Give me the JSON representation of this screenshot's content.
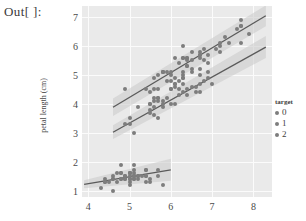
{
  "prompt": {
    "label": "Out[ ]:"
  },
  "chart_data": {
    "type": "scatter",
    "title": "",
    "xlabel": "",
    "ylabel": "petal length (cm)",
    "xlim": [
      3.85,
      8.45
    ],
    "ylim": [
      0.78,
      7.38
    ],
    "xticks": [
      "4",
      "5",
      "6",
      "7",
      "8"
    ],
    "xtick_values": [
      4,
      5,
      6,
      7,
      8
    ],
    "yticks": [
      "1",
      "2",
      "3",
      "4",
      "5",
      "6",
      "7"
    ],
    "ytick_values": [
      1,
      2,
      3,
      4,
      5,
      6,
      7
    ],
    "grid": true,
    "grid_color": "#fbfbfb",
    "plot_background": "#eaeaea",
    "point_color": "#7d7d7d",
    "line_color": "#5a5a5a",
    "band_color": "#c9c9c9",
    "legend": {
      "title": "target",
      "position": "right",
      "entries": [
        {
          "label": "0",
          "color": "#7d7d7d"
        },
        {
          "label": "1",
          "color": "#7d7d7d"
        },
        {
          "label": "2",
          "color": "#7d7d7d"
        }
      ]
    },
    "series": [
      {
        "name": "0",
        "color": "#7d7d7d",
        "fit": {
          "x": [
            3.9,
            6.0
          ],
          "y": [
            1.22,
            1.72
          ]
        },
        "band": {
          "x": [
            3.9,
            6.0
          ],
          "upper": [
            1.36,
            2.1
          ],
          "lower": [
            1.08,
            1.34
          ]
        },
        "points": [
          [
            5.1,
            1.4
          ],
          [
            4.9,
            1.4
          ],
          [
            4.7,
            1.3
          ],
          [
            4.6,
            1.5
          ],
          [
            5.0,
            1.4
          ],
          [
            5.4,
            1.7
          ],
          [
            4.6,
            1.4
          ],
          [
            5.0,
            1.5
          ],
          [
            4.4,
            1.4
          ],
          [
            4.9,
            1.5
          ],
          [
            5.4,
            1.5
          ],
          [
            4.8,
            1.6
          ],
          [
            4.8,
            1.4
          ],
          [
            4.3,
            1.1
          ],
          [
            5.8,
            1.2
          ],
          [
            5.7,
            1.5
          ],
          [
            5.4,
            1.3
          ],
          [
            5.1,
            1.4
          ],
          [
            5.7,
            1.7
          ],
          [
            5.1,
            1.5
          ],
          [
            5.4,
            1.7
          ],
          [
            5.1,
            1.5
          ],
          [
            4.6,
            1.0
          ],
          [
            5.1,
            1.7
          ],
          [
            4.8,
            1.9
          ],
          [
            5.0,
            1.6
          ],
          [
            5.0,
            1.6
          ],
          [
            5.2,
            1.5
          ],
          [
            5.2,
            1.4
          ],
          [
            4.7,
            1.6
          ],
          [
            4.8,
            1.6
          ],
          [
            5.4,
            1.5
          ],
          [
            5.2,
            1.5
          ],
          [
            5.5,
            1.4
          ],
          [
            4.9,
            1.5
          ],
          [
            5.0,
            1.2
          ],
          [
            5.5,
            1.3
          ],
          [
            4.9,
            1.4
          ],
          [
            4.4,
            1.3
          ],
          [
            5.1,
            1.5
          ],
          [
            5.0,
            1.3
          ],
          [
            4.5,
            1.3
          ],
          [
            4.4,
            1.3
          ],
          [
            5.0,
            1.6
          ],
          [
            5.1,
            1.9
          ],
          [
            4.8,
            1.4
          ],
          [
            5.1,
            1.6
          ],
          [
            4.6,
            1.4
          ],
          [
            5.3,
            1.5
          ],
          [
            5.0,
            1.4
          ]
        ]
      },
      {
        "name": "1",
        "color": "#7d7d7d",
        "fit": {
          "x": [
            4.6,
            8.3
          ],
          "y": [
            3.02,
            5.96
          ]
        },
        "band": {
          "x": [
            4.6,
            8.3
          ],
          "upper": [
            3.26,
            6.34
          ],
          "lower": [
            2.78,
            5.58
          ]
        },
        "points": [
          [
            7.0,
            4.7
          ],
          [
            6.4,
            4.5
          ],
          [
            6.9,
            4.9
          ],
          [
            5.5,
            4.0
          ],
          [
            6.5,
            4.6
          ],
          [
            5.7,
            4.5
          ],
          [
            6.3,
            4.7
          ],
          [
            4.9,
            3.3
          ],
          [
            6.6,
            4.6
          ],
          [
            5.2,
            3.9
          ],
          [
            5.0,
            3.5
          ],
          [
            5.9,
            4.2
          ],
          [
            6.0,
            4.0
          ],
          [
            6.1,
            4.7
          ],
          [
            5.6,
            3.6
          ],
          [
            6.7,
            4.4
          ],
          [
            5.6,
            4.5
          ],
          [
            5.8,
            4.1
          ],
          [
            6.2,
            4.5
          ],
          [
            5.6,
            3.9
          ],
          [
            5.9,
            4.8
          ],
          [
            6.1,
            4.0
          ],
          [
            6.3,
            4.9
          ],
          [
            6.1,
            4.7
          ],
          [
            6.4,
            4.3
          ],
          [
            6.6,
            4.4
          ],
          [
            6.8,
            4.8
          ],
          [
            6.7,
            5.0
          ],
          [
            6.0,
            4.5
          ],
          [
            5.7,
            3.5
          ],
          [
            5.5,
            3.8
          ],
          [
            5.5,
            3.7
          ],
          [
            5.8,
            3.9
          ],
          [
            6.0,
            5.1
          ],
          [
            5.4,
            4.5
          ],
          [
            6.0,
            4.5
          ],
          [
            6.7,
            4.7
          ],
          [
            6.3,
            4.4
          ],
          [
            5.6,
            4.1
          ],
          [
            5.5,
            4.0
          ],
          [
            5.5,
            4.4
          ],
          [
            6.1,
            4.6
          ],
          [
            5.8,
            4.0
          ],
          [
            5.0,
            3.3
          ],
          [
            5.6,
            4.2
          ],
          [
            5.7,
            4.2
          ],
          [
            5.7,
            4.2
          ],
          [
            6.2,
            4.3
          ],
          [
            5.1,
            3.0
          ],
          [
            5.7,
            4.1
          ]
        ]
      },
      {
        "name": "2",
        "color": "#7d7d7d",
        "fit": {
          "x": [
            4.6,
            8.3
          ],
          "y": [
            3.88,
            7.04
          ]
        },
        "band": {
          "x": [
            4.6,
            8.3
          ],
          "upper": [
            4.18,
            7.4
          ],
          "lower": [
            3.58,
            6.68
          ]
        },
        "points": [
          [
            6.3,
            6.0
          ],
          [
            5.8,
            5.1
          ],
          [
            7.1,
            5.9
          ],
          [
            6.3,
            5.6
          ],
          [
            6.5,
            5.8
          ],
          [
            7.6,
            6.6
          ],
          [
            4.9,
            4.5
          ],
          [
            7.3,
            6.3
          ],
          [
            6.7,
            5.8
          ],
          [
            7.2,
            6.1
          ],
          [
            6.5,
            5.1
          ],
          [
            6.4,
            5.3
          ],
          [
            6.8,
            5.5
          ],
          [
            5.7,
            5.0
          ],
          [
            5.8,
            5.1
          ],
          [
            6.4,
            5.3
          ],
          [
            6.5,
            5.5
          ],
          [
            7.7,
            6.7
          ],
          [
            7.7,
            6.9
          ],
          [
            6.0,
            5.0
          ],
          [
            6.9,
            5.7
          ],
          [
            5.6,
            4.9
          ],
          [
            7.7,
            6.7
          ],
          [
            6.3,
            4.9
          ],
          [
            6.7,
            5.7
          ],
          [
            7.2,
            6.0
          ],
          [
            6.2,
            4.8
          ],
          [
            6.1,
            4.9
          ],
          [
            6.4,
            5.6
          ],
          [
            7.2,
            5.8
          ],
          [
            7.4,
            6.1
          ],
          [
            7.9,
            6.4
          ],
          [
            6.4,
            5.6
          ],
          [
            6.3,
            5.1
          ],
          [
            6.1,
            5.6
          ],
          [
            7.7,
            6.1
          ],
          [
            6.3,
            5.6
          ],
          [
            6.4,
            5.5
          ],
          [
            6.0,
            4.8
          ],
          [
            6.9,
            5.4
          ],
          [
            6.7,
            5.6
          ],
          [
            6.9,
            5.1
          ],
          [
            5.8,
            5.1
          ],
          [
            6.8,
            5.9
          ],
          [
            6.7,
            5.7
          ],
          [
            6.7,
            5.2
          ],
          [
            6.3,
            5.0
          ],
          [
            6.5,
            5.2
          ],
          [
            6.2,
            5.4
          ],
          [
            5.9,
            5.1
          ]
        ]
      }
    ]
  }
}
